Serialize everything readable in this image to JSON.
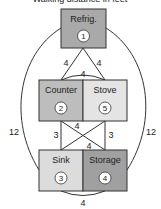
{
  "title": "Walking distance in feet",
  "nodes": [
    {
      "id": 1,
      "label": "Refrig.",
      "number": "1",
      "fill": "#a9a9a9"
    },
    {
      "id": 2,
      "label": "Counter",
      "number": "2",
      "fill": "#bdbdbd"
    },
    {
      "id": 5,
      "label": "Stove",
      "number": "5",
      "fill": "#e4e4e4"
    },
    {
      "id": 3,
      "label": "Sink",
      "number": "3",
      "fill": "#dcdcdc"
    },
    {
      "id": 4,
      "label": "Storage",
      "number": "4",
      "fill": "#a0a0a0"
    }
  ],
  "edges": [
    {
      "from": "1",
      "to": "2",
      "distance": "4"
    },
    {
      "from": "1",
      "to": "5",
      "distance": "4"
    },
    {
      "from": "2",
      "to": "5",
      "distance": "4"
    },
    {
      "from": "1",
      "to": "3",
      "distance": "12"
    },
    {
      "from": "1",
      "to": "4",
      "distance": "12"
    },
    {
      "from": "2",
      "to": "3",
      "distance": "3"
    },
    {
      "from": "5",
      "to": "4",
      "distance": "3"
    },
    {
      "from": "2",
      "to": "4",
      "distance": "4"
    },
    {
      "from": "5",
      "to": "3",
      "distance": "4"
    },
    {
      "from": "3",
      "to": "4",
      "distance": "4"
    }
  ]
}
